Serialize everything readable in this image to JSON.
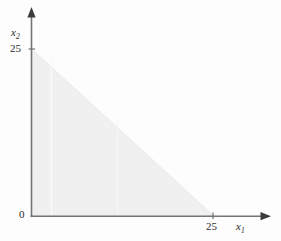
{
  "chart_data": {
    "type": "area",
    "title": "",
    "subtitle": "",
    "xlabel": "x1",
    "ylabel": "x2",
    "xlim": [
      0,
      30
    ],
    "ylim": [
      0,
      30
    ],
    "grid": false,
    "legend": null,
    "x_ticks": [
      {
        "value": 0,
        "label": "0"
      },
      {
        "value": 25,
        "label": "25"
      }
    ],
    "y_ticks": [
      {
        "value": 0,
        "label": "0"
      },
      {
        "value": 25,
        "label": "25"
      }
    ],
    "regions": [
      {
        "name": "feasible-region",
        "shape": "triangle",
        "fill": "#f0f0f0",
        "vertices": [
          {
            "x": 0,
            "y": 0
          },
          {
            "x": 0,
            "y": 25
          },
          {
            "x": 25,
            "y": 0
          }
        ],
        "boundary_line": {
          "description": "x1 + x2 = 25",
          "x_intercept": 25,
          "y_intercept": 25,
          "slope": -1
        }
      }
    ],
    "series": [
      {
        "name": "constraint-boundary",
        "x": [
          0,
          25
        ],
        "values": [
          25,
          0
        ]
      }
    ],
    "annotations": []
  },
  "axes": {
    "x": {
      "label_text": "x",
      "label_sub": "1",
      "tick_label": "25",
      "origin_label": "0"
    },
    "y": {
      "label_text": "x",
      "label_sub": "2",
      "tick_label": "25"
    }
  },
  "colors": {
    "background": "#fdfdfd",
    "axis": "#6f6f6f",
    "region_fill": "#f0f0f0",
    "text": "#2b2b2b"
  }
}
